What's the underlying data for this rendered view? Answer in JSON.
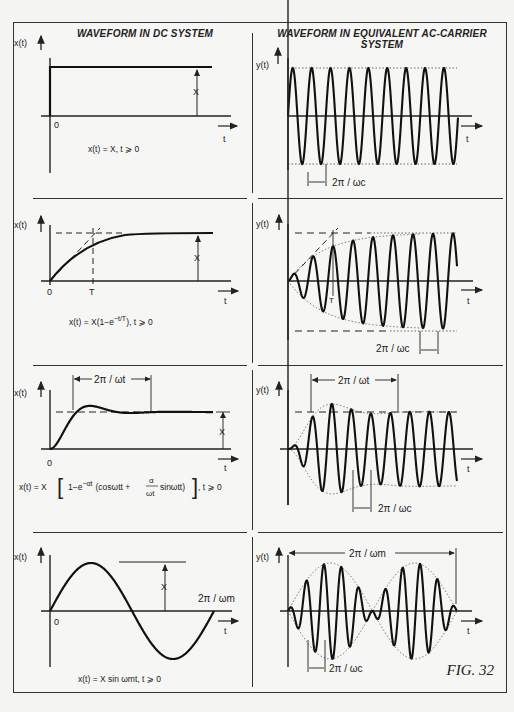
{
  "figure": {
    "label": "FIG. 32",
    "columns": {
      "left_title": "WAVEFORM IN DC SYSTEM",
      "right_title_line1": "WAVEFORM IN EQUIVALENT AC-CARRIER",
      "right_title_line2": "SYSTEM"
    },
    "axis_labels": {
      "x_dc": "x(t)",
      "y_ac": "y(t)",
      "t": "t",
      "origin": "0"
    },
    "rows": [
      {
        "name": "step",
        "dc_equation": "x(t) = X,  t ⩾ 0",
        "dc_amplitude_label": "X",
        "ac_period_label": "2π / ωc"
      },
      {
        "name": "exponential",
        "dc_equation": "x(t) = X(1−e^(−t/T)),  t ⩾ 0",
        "dc_equation_main": "x(t) = X(1−e",
        "dc_equation_sup": "−t/T",
        "dc_equation_tail": "),  t ⩾ 0",
        "dc_amplitude_label": "X",
        "dc_time_constant_label": "T",
        "ac_time_constant_label": "T",
        "ac_period_label": "2π / ωc"
      },
      {
        "name": "damped-oscillation",
        "dc_equation": "x(t) = X [1−e^(−αt) (cosωtt + (α/ωt) sinωtt)],  t ⩾ 0",
        "dc_equation_left": "x(t) = X",
        "dc_equation_inner": "1−e",
        "dc_equation_sup": "−αt",
        "dc_equation_paren": "(cosωtt +",
        "dc_equation_frac_num": "α",
        "dc_equation_frac_den": "ωt",
        "dc_equation_after_frac": "sinωtt)",
        "dc_equation_tail": ",  t ⩾ 0",
        "dc_amplitude_label": "X",
        "dc_period_label": "2π / ωt",
        "ac_envelope_period_label": "2π / ωt",
        "ac_period_label": "2π / ωc"
      },
      {
        "name": "sinusoidal-modulation",
        "dc_equation": "x(t) = X sin ωmt,   t ⩾ 0",
        "dc_amplitude_label": "X",
        "dc_period_label": "2π / ωm",
        "ac_envelope_period_label": "2π / ωm",
        "ac_period_label": "2π / ωc"
      }
    ]
  },
  "chart_data": {
    "type": "line",
    "panels": [
      {
        "row": 1,
        "column": "DC",
        "function": "x(t) = X for t ≥ 0",
        "shape": "step"
      },
      {
        "row": 1,
        "column": "AC",
        "function": "y(t) = X sin(ωc t)",
        "shape": "constant-amplitude carrier",
        "cycles_shown": 9
      },
      {
        "row": 2,
        "column": "DC",
        "function": "x(t) = X(1 − e^(−t/T))",
        "shape": "exponential rise",
        "markers": [
          "T"
        ]
      },
      {
        "row": 2,
        "column": "AC",
        "function": "y(t) = X(1 − e^(−t/T)) sin(ωc t)",
        "shape": "carrier with exponential envelope",
        "markers": [
          "T"
        ]
      },
      {
        "row": 3,
        "column": "DC",
        "function": "x(t) = X[1 − e^(−αt)(cos ωt t + (α/ωt) sin ωt t)]",
        "shape": "damped oscillatory rise",
        "markers": [
          "2π/ωt"
        ]
      },
      {
        "row": 3,
        "column": "AC",
        "function": "y(t) = x(t) sin(ωc t)",
        "shape": "carrier with damped oscillating envelope",
        "markers": [
          "2π/ωt",
          "2π/ωc"
        ]
      },
      {
        "row": 4,
        "column": "DC",
        "function": "x(t) = X sin(ωm t)",
        "shape": "sine, one period",
        "markers": [
          "2π/ωm"
        ]
      },
      {
        "row": 4,
        "column": "AC",
        "function": "y(t) = X sin(ωm t) sin(ωc t)",
        "shape": "double-sideband modulated carrier",
        "markers": [
          "2π/ωm",
          "2π/ωc"
        ]
      }
    ],
    "xlabel": "t",
    "ylabel": "x(t) / y(t)",
    "grid": false
  }
}
